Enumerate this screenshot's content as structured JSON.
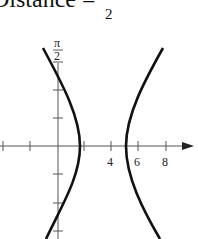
{
  "caption": {
    "text": "Distance =",
    "fraction_denominator": "2"
  },
  "graph": {
    "polar_axis_label_num": "π",
    "polar_axis_label_den": "2",
    "x_tick_labels": [
      "4",
      "6",
      "8"
    ],
    "curve": "hyperbola, two branches opening left/right",
    "colors": {
      "axis": "#555555",
      "curve": "#111111"
    }
  }
}
